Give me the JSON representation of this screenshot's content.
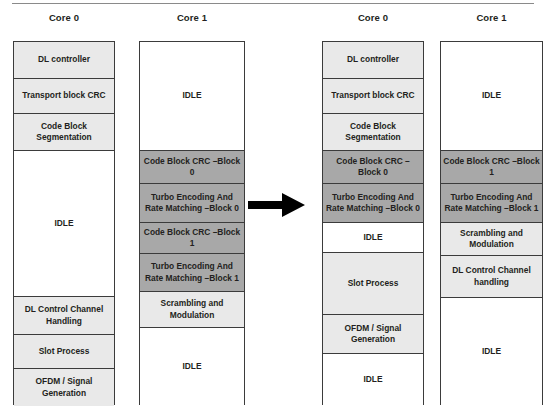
{
  "diagram": {
    "type": "timeline-gantt",
    "colors": {
      "light_shade": "#e9e9e9",
      "dark_shade": "#a8a8a8",
      "no_shade": "#ffffff",
      "border": "#3b3b3b",
      "text": "#231f20",
      "arrow": "#000000"
    },
    "arrow": {
      "name": "transition-arrow",
      "direction": "right",
      "label": ""
    },
    "panels": [
      {
        "id": "left-panel",
        "columns": [
          {
            "id": "left-core-0",
            "title": "Core 0",
            "blocks": [
              {
                "label": "DL controller",
                "shade": "light",
                "top": 41,
                "height": 37
              },
              {
                "label": "Transport block CRC",
                "shade": "light",
                "top": 78,
                "height": 35
              },
              {
                "label": "Code Block Segmentation",
                "shade": "light",
                "top": 113,
                "height": 37
              },
              {
                "label": "IDLE",
                "shade": "none",
                "top": 150,
                "height": 146
              },
              {
                "label": "DL Control Channel Handling",
                "shade": "light",
                "top": 296,
                "height": 38
              },
              {
                "label": "Slot Process",
                "shade": "light",
                "top": 334,
                "height": 34
              },
              {
                "label": "OFDM / Signal Generation",
                "shade": "light",
                "top": 368,
                "height": 37
              }
            ]
          },
          {
            "id": "left-core-1",
            "title": "Core 1",
            "blocks": [
              {
                "label": "IDLE",
                "shade": "none",
                "top": 41,
                "height": 109
              },
              {
                "label": "Code Block CRC –Block 0",
                "shade": "dark",
                "top": 150,
                "height": 33
              },
              {
                "label": "Turbo Encoding And Rate Matching –Block 0",
                "shade": "dark",
                "top": 183,
                "height": 39
              },
              {
                "label": "Code Block CRC –Block 1",
                "shade": "dark",
                "top": 222,
                "height": 31
              },
              {
                "label": "Turbo Encoding And Rate Matching –Block 1",
                "shade": "dark",
                "top": 253,
                "height": 38
              },
              {
                "label": "Scrambling and Modulation",
                "shade": "light",
                "top": 291,
                "height": 36
              },
              {
                "label": "IDLE",
                "shade": "none",
                "top": 327,
                "height": 78
              }
            ]
          }
        ]
      },
      {
        "id": "right-panel",
        "columns": [
          {
            "id": "right-core-0",
            "title": "Core 0",
            "blocks": [
              {
                "label": "DL controller",
                "shade": "light",
                "top": 41,
                "height": 37
              },
              {
                "label": "Transport block CRC",
                "shade": "light",
                "top": 78,
                "height": 35
              },
              {
                "label": "Code Block Segmentation",
                "shade": "light",
                "top": 113,
                "height": 37
              },
              {
                "label": "Code Block CRC –Block 0",
                "shade": "dark",
                "top": 150,
                "height": 33
              },
              {
                "label": "Turbo Encoding And Rate Matching –Block 0",
                "shade": "dark",
                "top": 183,
                "height": 39
              },
              {
                "label": "IDLE",
                "shade": "none",
                "top": 222,
                "height": 30
              },
              {
                "label": "Slot Process",
                "shade": "light",
                "top": 252,
                "height": 62
              },
              {
                "label": "OFDM / Signal Generation",
                "shade": "light",
                "top": 314,
                "height": 39
              },
              {
                "label": "IDLE",
                "shade": "none",
                "top": 353,
                "height": 52
              }
            ]
          },
          {
            "id": "right-core-1",
            "title": "Core 1",
            "blocks": [
              {
                "label": "IDLE",
                "shade": "none",
                "top": 41,
                "height": 109
              },
              {
                "label": "Code Block CRC –Block 1",
                "shade": "dark",
                "top": 150,
                "height": 33
              },
              {
                "label": "Turbo Encoding And Rate Matching –Block 1",
                "shade": "dark",
                "top": 183,
                "height": 39
              },
              {
                "label": "Scrambling and Modulation",
                "shade": "light",
                "top": 222,
                "height": 33
              },
              {
                "label": "DL Control Channel handling",
                "shade": "light",
                "top": 255,
                "height": 42
              },
              {
                "label": "IDLE",
                "shade": "none",
                "top": 297,
                "height": 108
              }
            ]
          }
        ]
      }
    ],
    "column_geometry": [
      {
        "left": 13,
        "width": 102,
        "title_left": 13,
        "title_top": 12
      },
      {
        "left": 139,
        "width": 106,
        "title_left": 139,
        "title_top": 12
      },
      {
        "left": 322,
        "width": 102,
        "title_left": 322,
        "title_top": 12
      },
      {
        "left": 440,
        "width": 103,
        "title_left": 440,
        "title_top": 12
      }
    ]
  }
}
